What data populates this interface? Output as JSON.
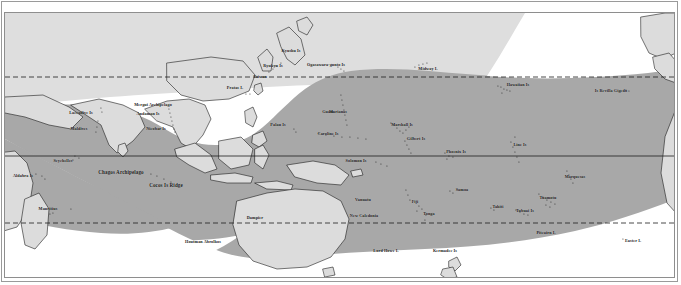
{
  "figure": {
    "name": "world-distribution-map",
    "colors": {
      "ocean_shade": "#a6a6a6",
      "ocean_light": "#d4d4d4",
      "land_fill": "#d9d9d9",
      "land_outline": "#1a1a1a",
      "background": "#ffffff",
      "frame": "#8e8e8e",
      "label": "#1a1a1a"
    }
  },
  "grid": {
    "equator": {
      "label": "Equator",
      "y": 155,
      "style": "solid"
    },
    "tropic_of_cancer": {
      "label": "Tropic of Cancer",
      "y": 76,
      "style": "dashed"
    },
    "tropic_of_capricorn": {
      "label": "Tropic of Capricorn",
      "y": 222,
      "style": "dashed"
    }
  },
  "labels": [
    {
      "id": "aldabra-is",
      "text": "Aldabra Is",
      "x": 22,
      "y": 175,
      "size": "sz4"
    },
    {
      "id": "seychelles",
      "text": "Seychelles",
      "x": 62,
      "y": 160,
      "size": "sz4"
    },
    {
      "id": "chagos-archipelago",
      "text": "Chagos Archipelago",
      "x": 120,
      "y": 172,
      "size": "sz5"
    },
    {
      "id": "cocos-is-ridge",
      "text": "Cocos Is Ridge",
      "x": 165,
      "y": 185,
      "size": "sz5"
    },
    {
      "id": "mauritius",
      "text": "Mauritius",
      "x": 47,
      "y": 208,
      "size": "sz4"
    },
    {
      "id": "laccadive-is",
      "text": "Laccadive Is",
      "x": 80,
      "y": 112,
      "size": "sz4"
    },
    {
      "id": "maldives",
      "text": "Maldives",
      "x": 78,
      "y": 128,
      "size": "sz4"
    },
    {
      "id": "mergui-archipelago",
      "text": "Mergui Archipelago",
      "x": 152,
      "y": 104,
      "size": "sz4"
    },
    {
      "id": "andaman-is",
      "text": "Andaman Is",
      "x": 147,
      "y": 113,
      "size": "sz4"
    },
    {
      "id": "nicobar-is",
      "text": "Nicobar Is",
      "x": 155,
      "y": 128,
      "size": "sz4"
    },
    {
      "id": "houtman-abrolhos",
      "text": "Houtman Abrolhos",
      "x": 202,
      "y": 241,
      "size": "sz4"
    },
    {
      "id": "dampier",
      "text": "Dampier",
      "x": 254,
      "y": 217,
      "size": "sz4"
    },
    {
      "id": "pratas-i",
      "text": "Pratas I.",
      "x": 234,
      "y": 87,
      "size": "sz4"
    },
    {
      "id": "taiwan",
      "text": "Taiwan",
      "x": 259,
      "y": 76,
      "size": "sz4"
    },
    {
      "id": "ryukyu-is",
      "text": "Ryukyu Is",
      "x": 272,
      "y": 65,
      "size": "sz4"
    },
    {
      "id": "kyushu-is",
      "text": "Kyushu Is",
      "x": 290,
      "y": 50,
      "size": "sz4"
    },
    {
      "id": "ogasawara-gunto-is",
      "text": "Ogasawara-gunto Is",
      "x": 325,
      "y": 64,
      "size": "sz4"
    },
    {
      "id": "palau-is",
      "text": "Palau Is",
      "x": 277,
      "y": 124,
      "size": "sz4"
    },
    {
      "id": "marianas",
      "text": "Marianas",
      "x": 337,
      "y": 111,
      "size": "sz4"
    },
    {
      "id": "guam",
      "text": "Guam",
      "x": 327,
      "y": 111,
      "size": "sz4"
    },
    {
      "id": "caroline-is",
      "text": "Caroline Is",
      "x": 327,
      "y": 133,
      "size": "sz4"
    },
    {
      "id": "marshall-is",
      "text": "Marshall Is",
      "x": 401,
      "y": 124,
      "size": "sz4"
    },
    {
      "id": "gilbert-is",
      "text": "Gilbert Is",
      "x": 415,
      "y": 138,
      "size": "sz4"
    },
    {
      "id": "phoenix-is",
      "text": "Phoenix Is",
      "x": 455,
      "y": 151,
      "size": "sz4"
    },
    {
      "id": "line-is",
      "text": "Line Is",
      "x": 519,
      "y": 144,
      "size": "sz4"
    },
    {
      "id": "midway-i",
      "text": "Midway I.",
      "x": 427,
      "y": 68,
      "size": "sz4"
    },
    {
      "id": "hawaiian-is",
      "text": "Hawaiian Is",
      "x": 517,
      "y": 84,
      "size": "sz4"
    },
    {
      "id": "is-revilla-gigedo",
      "text": "Is Revilla Gigedo",
      "x": 610,
      "y": 90,
      "size": "sz4"
    },
    {
      "id": "solomon-is",
      "text": "Solomon Is",
      "x": 355,
      "y": 160,
      "size": "sz4"
    },
    {
      "id": "vanuatu",
      "text": "Vanuatu",
      "x": 362,
      "y": 199,
      "size": "sz4"
    },
    {
      "id": "new-caledonia",
      "text": "New Caledonia",
      "x": 363,
      "y": 215,
      "size": "sz4"
    },
    {
      "id": "fiji",
      "text": "Fiji",
      "x": 414,
      "y": 201,
      "size": "sz4"
    },
    {
      "id": "samoa",
      "text": "Samoa",
      "x": 461,
      "y": 189,
      "size": "sz4"
    },
    {
      "id": "tonga",
      "text": "Tonga",
      "x": 428,
      "y": 213,
      "size": "sz4"
    },
    {
      "id": "tahiti",
      "text": "Tahiti",
      "x": 497,
      "y": 206,
      "size": "sz4"
    },
    {
      "id": "tubuai-is",
      "text": "Tubuai Is",
      "x": 524,
      "y": 210,
      "size": "sz4"
    },
    {
      "id": "tuamotu",
      "text": "Tuamotu",
      "x": 547,
      "y": 197,
      "size": "sz4"
    },
    {
      "id": "marquesas",
      "text": "Marquesas",
      "x": 574,
      "y": 176,
      "size": "sz4"
    },
    {
      "id": "pitcairn-i",
      "text": "Pitcairn I.",
      "x": 545,
      "y": 232,
      "size": "sz4"
    },
    {
      "id": "easter-i",
      "text": "Easter I.",
      "x": 632,
      "y": 240,
      "size": "sz4"
    },
    {
      "id": "lord-howe-i",
      "text": "Lord Howe I.",
      "x": 385,
      "y": 250,
      "size": "sz4"
    },
    {
      "id": "kermadec-is",
      "text": "Kermadec Is",
      "x": 444,
      "y": 250,
      "size": "sz4"
    }
  ],
  "island_dots": [
    {
      "x": 35,
      "y": 173
    },
    {
      "x": 41,
      "y": 175
    },
    {
      "x": 44,
      "y": 178
    },
    {
      "x": 74,
      "y": 155
    },
    {
      "x": 78,
      "y": 157
    },
    {
      "x": 72,
      "y": 159
    },
    {
      "x": 49,
      "y": 213
    },
    {
      "x": 52,
      "y": 212
    },
    {
      "x": 70,
      "y": 208
    },
    {
      "x": 97,
      "y": 120
    },
    {
      "x": 96,
      "y": 126
    },
    {
      "x": 95,
      "y": 131
    },
    {
      "x": 100,
      "y": 107
    },
    {
      "x": 101,
      "y": 111
    },
    {
      "x": 168,
      "y": 108
    },
    {
      "x": 169,
      "y": 112
    },
    {
      "x": 170,
      "y": 116
    },
    {
      "x": 171,
      "y": 120
    },
    {
      "x": 172,
      "y": 124
    },
    {
      "x": 173,
      "y": 128
    },
    {
      "x": 174,
      "y": 131
    },
    {
      "x": 150,
      "y": 173
    },
    {
      "x": 156,
      "y": 175
    },
    {
      "x": 163,
      "y": 178
    },
    {
      "x": 170,
      "y": 181
    },
    {
      "x": 245,
      "y": 93
    },
    {
      "x": 249,
      "y": 93
    },
    {
      "x": 268,
      "y": 71
    },
    {
      "x": 272,
      "y": 68
    },
    {
      "x": 276,
      "y": 65
    },
    {
      "x": 280,
      "y": 62
    },
    {
      "x": 337,
      "y": 66
    },
    {
      "x": 340,
      "y": 68
    },
    {
      "x": 343,
      "y": 70
    },
    {
      "x": 340,
      "y": 94
    },
    {
      "x": 341,
      "y": 99
    },
    {
      "x": 342,
      "y": 104
    },
    {
      "x": 343,
      "y": 109
    },
    {
      "x": 344,
      "y": 114
    },
    {
      "x": 345,
      "y": 119
    },
    {
      "x": 346,
      "y": 124
    },
    {
      "x": 293,
      "y": 128
    },
    {
      "x": 295,
      "y": 131
    },
    {
      "x": 318,
      "y": 132
    },
    {
      "x": 325,
      "y": 134
    },
    {
      "x": 333,
      "y": 135
    },
    {
      "x": 341,
      "y": 136
    },
    {
      "x": 349,
      "y": 136
    },
    {
      "x": 357,
      "y": 137
    },
    {
      "x": 365,
      "y": 138
    },
    {
      "x": 390,
      "y": 122
    },
    {
      "x": 393,
      "y": 124
    },
    {
      "x": 396,
      "y": 127
    },
    {
      "x": 399,
      "y": 130
    },
    {
      "x": 402,
      "y": 132
    },
    {
      "x": 405,
      "y": 129
    },
    {
      "x": 408,
      "y": 126
    },
    {
      "x": 404,
      "y": 140
    },
    {
      "x": 406,
      "y": 144
    },
    {
      "x": 408,
      "y": 148
    },
    {
      "x": 410,
      "y": 152
    },
    {
      "x": 444,
      "y": 152
    },
    {
      "x": 448,
      "y": 155
    },
    {
      "x": 452,
      "y": 156
    },
    {
      "x": 446,
      "y": 158
    },
    {
      "x": 510,
      "y": 141
    },
    {
      "x": 512,
      "y": 146
    },
    {
      "x": 514,
      "y": 151
    },
    {
      "x": 516,
      "y": 156
    },
    {
      "x": 518,
      "y": 161
    },
    {
      "x": 514,
      "y": 136
    },
    {
      "x": 414,
      "y": 66
    },
    {
      "x": 418,
      "y": 64
    },
    {
      "x": 422,
      "y": 63
    },
    {
      "x": 426,
      "y": 62
    },
    {
      "x": 497,
      "y": 85
    },
    {
      "x": 500,
      "y": 86
    },
    {
      "x": 503,
      "y": 88
    },
    {
      "x": 506,
      "y": 89
    },
    {
      "x": 509,
      "y": 90
    },
    {
      "x": 501,
      "y": 92
    },
    {
      "x": 625,
      "y": 89
    },
    {
      "x": 628,
      "y": 90
    },
    {
      "x": 375,
      "y": 161
    },
    {
      "x": 380,
      "y": 163
    },
    {
      "x": 386,
      "y": 165
    },
    {
      "x": 405,
      "y": 189
    },
    {
      "x": 407,
      "y": 194
    },
    {
      "x": 409,
      "y": 199
    },
    {
      "x": 418,
      "y": 205
    },
    {
      "x": 421,
      "y": 208
    },
    {
      "x": 416,
      "y": 210
    },
    {
      "x": 449,
      "y": 190
    },
    {
      "x": 452,
      "y": 192
    },
    {
      "x": 425,
      "y": 214
    },
    {
      "x": 424,
      "y": 219
    },
    {
      "x": 490,
      "y": 207
    },
    {
      "x": 493,
      "y": 209
    },
    {
      "x": 515,
      "y": 209
    },
    {
      "x": 519,
      "y": 211
    },
    {
      "x": 523,
      "y": 213
    },
    {
      "x": 527,
      "y": 214
    },
    {
      "x": 538,
      "y": 193
    },
    {
      "x": 542,
      "y": 196
    },
    {
      "x": 546,
      "y": 199
    },
    {
      "x": 550,
      "y": 201
    },
    {
      "x": 554,
      "y": 203
    },
    {
      "x": 545,
      "y": 204
    },
    {
      "x": 549,
      "y": 206
    },
    {
      "x": 566,
      "y": 170
    },
    {
      "x": 568,
      "y": 174
    },
    {
      "x": 570,
      "y": 178
    },
    {
      "x": 572,
      "y": 182
    },
    {
      "x": 537,
      "y": 231
    },
    {
      "x": 622,
      "y": 238
    }
  ]
}
